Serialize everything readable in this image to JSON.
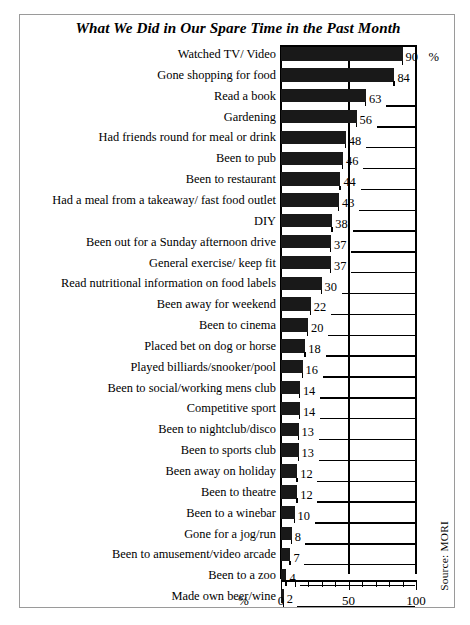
{
  "chart_data": {
    "type": "bar",
    "orientation": "horizontal",
    "title": "What We Did in Our Spare Time in the Past Month",
    "xlabel": "%",
    "ylabel": "",
    "xlim": [
      0,
      100
    ],
    "xticks": [
      0,
      50,
      100
    ],
    "xtick_labels": [
      "0",
      "50",
      "100"
    ],
    "minor_tick_step": 10,
    "grid": "vertical gridline at 50 only",
    "legend": "none",
    "source": "Source: MORI",
    "unit_suffix": "%",
    "categories": [
      "Watched TV/ Video",
      "Gone shopping for food",
      "Read a book",
      "Gardening",
      "Had friends round for meal or drink",
      "Been to pub",
      "Been to restaurant",
      "Had a meal from a takeaway/ fast food outlet",
      "DIY",
      "Been out for a Sunday afternoon drive",
      "General exercise/ keep fit",
      "Read nutritional information on food labels",
      "Been away for weekend",
      "Been to cinema",
      "Placed bet on dog or horse",
      "Played billiards/snooker/pool",
      "Been to social/working mens club",
      "Competitive sport",
      "Been to nightclub/disco",
      "Been to sports club",
      "Been away on holiday",
      "Been to theatre",
      "Been to a winebar",
      "Gone for a jog/run",
      "Been to amusement/video arcade",
      "Been to a zoo",
      "Made own beer/wine"
    ],
    "values": [
      90,
      84,
      63,
      56,
      48,
      46,
      44,
      43,
      38,
      37,
      37,
      30,
      22,
      20,
      18,
      16,
      14,
      14,
      13,
      13,
      12,
      12,
      10,
      8,
      7,
      4,
      2
    ],
    "value_labels": [
      "90",
      "84",
      "63",
      "56",
      "48",
      "46",
      "44",
      "43",
      "38",
      "37",
      "37",
      "30",
      "22",
      "20",
      "18",
      "16",
      "14",
      "14",
      "13",
      "13",
      "12",
      "12",
      "10",
      "8",
      "7",
      "4",
      "2"
    ],
    "bar_color": "#191919"
  },
  "axis": {
    "percent_symbol": "%",
    "tick_0": "0",
    "tick_50": "50",
    "tick_100": "100"
  },
  "footer": {
    "source": "Source: MORI"
  }
}
